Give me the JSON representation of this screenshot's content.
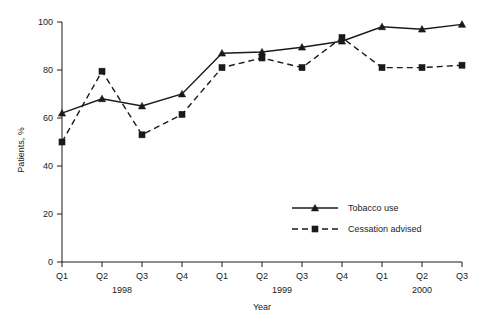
{
  "chart_data": {
    "type": "line",
    "title": "",
    "xlabel": "Year",
    "ylabel": "Patients, %",
    "ylim": [
      0,
      100
    ],
    "yticks": [
      0,
      20,
      40,
      60,
      80,
      100
    ],
    "grid": false,
    "legend_position": "center-right-inside",
    "categories": [
      "Q1",
      "Q2",
      "Q3",
      "Q4",
      "Q1",
      "Q2",
      "Q3",
      "Q4",
      "Q1",
      "Q2",
      "Q3"
    ],
    "group_labels": [
      {
        "label": "1998",
        "spans": [
          "Q1",
          "Q2",
          "Q3",
          "Q4"
        ]
      },
      {
        "label": "1999",
        "spans": [
          "Q1",
          "Q2",
          "Q3",
          "Q4"
        ]
      },
      {
        "label": "2000",
        "spans": [
          "Q1",
          "Q2",
          "Q3"
        ]
      }
    ],
    "series": [
      {
        "name": "Tobacco use",
        "marker": "triangle",
        "line_style": "solid",
        "color": "#1a1a1a",
        "values": [
          62,
          68,
          65,
          70,
          87,
          87.5,
          89.5,
          92,
          98,
          97,
          99
        ]
      },
      {
        "name": "Cessation advised",
        "marker": "square",
        "line_style": "dashed",
        "color": "#1a1a1a",
        "values": [
          50,
          79.5,
          53,
          61.5,
          81,
          85,
          81,
          93.5,
          81,
          81,
          82
        ]
      }
    ]
  },
  "axes": {
    "y_title": "Patients, %",
    "x_title": "Year",
    "y_tick_labels": [
      "0",
      "20",
      "40",
      "60",
      "80",
      "100"
    ],
    "x_tick_labels": [
      "Q1",
      "Q2",
      "Q3",
      "Q4",
      "Q1",
      "Q2",
      "Q3",
      "Q4",
      "Q1",
      "Q2",
      "Q3"
    ],
    "year_labels": [
      "1998",
      "1999",
      "2000"
    ]
  },
  "legend": {
    "items": [
      {
        "label": "Tobacco use",
        "marker": "triangle",
        "style": "solid"
      },
      {
        "label": "Cessation advised",
        "marker": "square",
        "style": "dashed"
      }
    ]
  }
}
